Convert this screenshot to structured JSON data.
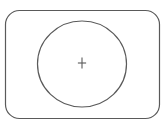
{
  "diagram": {
    "width": 165,
    "height": 123,
    "stroke_color": "#5a5a5a",
    "background": "#ffffff",
    "frame": {
      "shape": "rounded-rectangle",
      "x": 5.5,
      "y": 10.5,
      "width": 154,
      "height": 108,
      "radius": 14
    },
    "circle": {
      "shape": "ellipse",
      "cx": 82,
      "cy": 64,
      "rx": 44.5,
      "ry": 43
    },
    "center_mark": {
      "shape": "plus",
      "cx": 82,
      "cy": 63,
      "size": 11,
      "symbol": "+"
    }
  }
}
